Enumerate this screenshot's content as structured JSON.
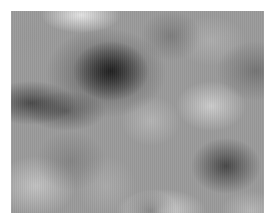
{
  "image": {
    "description": "Grayscale cloud / fractal noise texture",
    "colors": {
      "background": "#ffffff",
      "base_gray": "#9a9a9a",
      "darkest": "#141414",
      "lightest": "#ebebeb"
    }
  }
}
